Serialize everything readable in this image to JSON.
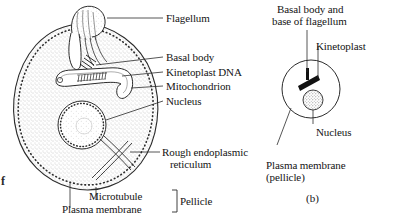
{
  "figure": {
    "edge_artifact": "f",
    "panel_a": {
      "caption": "",
      "labels": [
        {
          "id": "flagellum",
          "text": "Flagellum"
        },
        {
          "id": "basal-body",
          "text": "Basal body"
        },
        {
          "id": "kinetoplast-dna",
          "text": "Kinetoplast DNA"
        },
        {
          "id": "mitochondrion",
          "text": "Mitochondrion"
        },
        {
          "id": "nucleus",
          "text": "Nucleus"
        },
        {
          "id": "rough-er-line1",
          "text": "Rough endoplasmic"
        },
        {
          "id": "rough-er-line2",
          "text": "reticulum"
        },
        {
          "id": "microtubule",
          "text": "Microtubule"
        },
        {
          "id": "plasma-membrane",
          "text": "Plasma membrane"
        },
        {
          "id": "pellicle",
          "text": "Pellicle"
        }
      ]
    },
    "panel_b": {
      "caption": "(b)",
      "labels": [
        {
          "id": "basal-body-flagellum-line1",
          "text": "Basal body and"
        },
        {
          "id": "basal-body-flagellum-line2",
          "text": "base of flagellum"
        },
        {
          "id": "kinetoplast",
          "text": "Kinetoplast"
        },
        {
          "id": "nucleus",
          "text": "Nucleus"
        },
        {
          "id": "plasma-membrane-line1",
          "text": "Plasma membrane"
        },
        {
          "id": "plasma-membrane-line2",
          "text": "(pellicle)"
        }
      ]
    },
    "colors": {
      "ink": "#1a1a1a",
      "line": "#2b2b2b",
      "cytoplasm_stipple": "#8d8d8d",
      "organelle_fill": "#ffffff",
      "dark_body": "#111111",
      "paper": "#ffffff"
    }
  }
}
